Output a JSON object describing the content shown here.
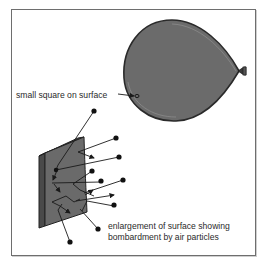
{
  "diagram": {
    "labels": {
      "small_square": "small square on surface",
      "enlargement_line1": "enlargement of surface showing",
      "enlargement_line2": "bombardment by air particles"
    },
    "colors": {
      "balloon_fill": "#6b6b6b",
      "surface_fill": "#6a6a6a",
      "line": "#1a1a1a",
      "border": "#6e6e6e"
    },
    "elements": [
      "balloon",
      "balloon-knot",
      "small-square-marker",
      "surface-panel",
      "air-particles",
      "particle-paths"
    ]
  }
}
